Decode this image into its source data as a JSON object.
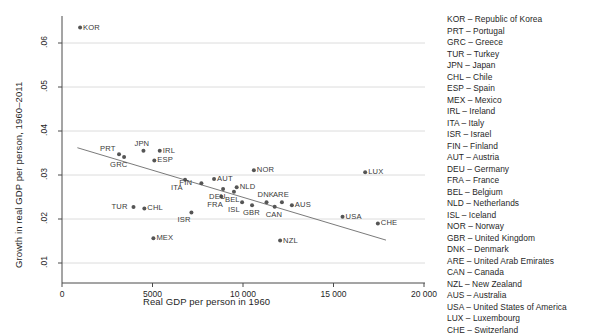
{
  "chart_data": {
    "type": "scatter",
    "title": "",
    "xlabel": "Real GDP per person in 1960",
    "ylabel": "Growth in real GDP per person, 1960–2011",
    "xlim": [
      0,
      20000
    ],
    "ylim": [
      0.01,
      0.065
    ],
    "xticks": [
      0,
      5000,
      10000,
      15000,
      20000
    ],
    "xticklabels": [
      "0",
      "5000",
      "10 000",
      "15 000",
      "20 000"
    ],
    "yticks": [
      0.01,
      0.02,
      0.03,
      0.04,
      0.05,
      0.06
    ],
    "yticklabels": [
      ".01",
      ".02",
      ".03",
      ".04",
      ".05",
      ".06"
    ],
    "grid": "horizontal",
    "legend_position": "right",
    "marker_color": "#555555",
    "trendline_color": "#6b6b6b",
    "gridline_color": "#d8d8d8",
    "axis_color": "#4a4a4a",
    "trendline": {
      "x0": 850,
      "y0": 0.0362,
      "x1": 17900,
      "y1": 0.0152
    },
    "points": [
      {
        "code": "KOR",
        "x": 1000,
        "y": 0.0635,
        "label_side": "right"
      },
      {
        "code": "PRT",
        "x": 3150,
        "y": 0.0347,
        "label_side": "above-left"
      },
      {
        "code": "GRC",
        "x": 3430,
        "y": 0.0341,
        "label_side": "below-left"
      },
      {
        "code": "JPN",
        "x": 4500,
        "y": 0.0355,
        "label_side": "above"
      },
      {
        "code": "IRL",
        "x": 5400,
        "y": 0.0355,
        "label_side": "right"
      },
      {
        "code": "ESP",
        "x": 5100,
        "y": 0.0333,
        "label_side": "right"
      },
      {
        "code": "TUR",
        "x": 3950,
        "y": 0.0227,
        "label_side": "left"
      },
      {
        "code": "CHL",
        "x": 4550,
        "y": 0.0224,
        "label_side": "right"
      },
      {
        "code": "MEX",
        "x": 5050,
        "y": 0.0156,
        "label_side": "right"
      },
      {
        "code": "ITA",
        "x": 6800,
        "y": 0.0289,
        "label_side": "below-left"
      },
      {
        "code": "ISR",
        "x": 7150,
        "y": 0.0215,
        "label_side": "below-left"
      },
      {
        "code": "FIN",
        "x": 7700,
        "y": 0.0281,
        "label_side": "left"
      },
      {
        "code": "AUT",
        "x": 8400,
        "y": 0.0291,
        "label_side": "right"
      },
      {
        "code": "DEU",
        "x": 8900,
        "y": 0.0268,
        "label_side": "below-left"
      },
      {
        "code": "FRA",
        "x": 8800,
        "y": 0.0251,
        "label_side": "below-left"
      },
      {
        "code": "NLD",
        "x": 9650,
        "y": 0.0272,
        "label_side": "right"
      },
      {
        "code": "BEL",
        "x": 9500,
        "y": 0.0262,
        "label_side": "below"
      },
      {
        "code": "ISL",
        "x": 9950,
        "y": 0.0238,
        "label_side": "below-left"
      },
      {
        "code": "GBR",
        "x": 10500,
        "y": 0.0231,
        "label_side": "below"
      },
      {
        "code": "NOR",
        "x": 10600,
        "y": 0.0311,
        "label_side": "right"
      },
      {
        "code": "DNK",
        "x": 11300,
        "y": 0.0238,
        "label_side": "above"
      },
      {
        "code": "CAN",
        "x": 11750,
        "y": 0.0228,
        "label_side": "below"
      },
      {
        "code": "ARE",
        "x": 12150,
        "y": 0.0238,
        "label_side": "above"
      },
      {
        "code": "AUS",
        "x": 12700,
        "y": 0.0231,
        "label_side": "right"
      },
      {
        "code": "NZL",
        "x": 12050,
        "y": 0.0151,
        "label_side": "right"
      },
      {
        "code": "USA",
        "x": 15500,
        "y": 0.0205,
        "label_side": "right"
      },
      {
        "code": "LUX",
        "x": 16750,
        "y": 0.0306,
        "label_side": "right"
      },
      {
        "code": "CHE",
        "x": 17450,
        "y": 0.019,
        "label_side": "right"
      }
    ]
  },
  "legend": {
    "entries": [
      "KOR – Republic of Korea",
      "PRT – Portugal",
      "GRC – Greece",
      "TUR – Turkey",
      "JPN – Japan",
      "CHL – Chile",
      "ESP – Spain",
      "MEX – Mexico",
      "IRL – Ireland",
      "ITA – Italy",
      "ISR – Israel",
      "FIN – Finland",
      "AUT – Austria",
      "DEU – Germany",
      "FRA – France",
      "BEL – Belgium",
      "NLD – Netherlands",
      "ISL – Iceland",
      "NOR – Norway",
      "GBR – United Kingdom",
      "DNK – Denmark",
      "ARE – United Arab Emirates",
      "CAN – Canada",
      "NZL – New Zealand",
      "AUS – Australia",
      "USA – United States of America",
      "LUX – Luxembourg",
      "CHE – Switzerland"
    ]
  }
}
